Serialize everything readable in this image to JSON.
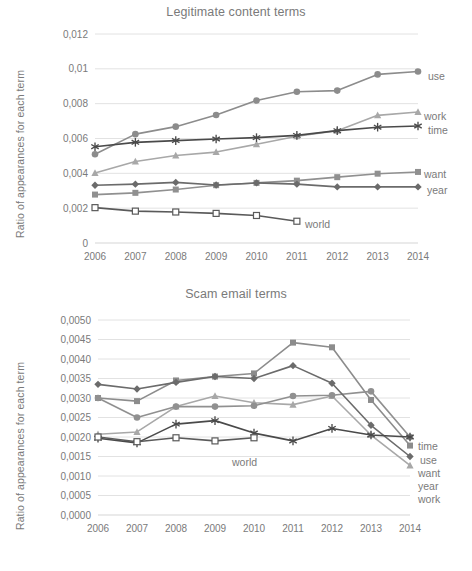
{
  "figure": {
    "panels": [
      "Legitimate content terms",
      "Scam email terms"
    ]
  },
  "top": {
    "title": "Legitimate content terms",
    "y_axis_title": "Ratio of appearances  for each term",
    "y_ticks": [
      "0",
      "0,002",
      "0,004",
      "0,006",
      "0,008",
      "0,01",
      "0,012"
    ],
    "x_ticks": [
      "2006",
      "2007",
      "2008",
      "2009",
      "2010",
      "2011",
      "2012",
      "2013",
      "2014"
    ],
    "labels": {
      "use": "use",
      "work": "work",
      "time": "time",
      "want": "want",
      "year": "year",
      "world": "world"
    }
  },
  "bottom": {
    "title": "Scam email terms",
    "y_axis_title": "Ratio of appearances  for each term",
    "y_ticks": [
      "0,0000",
      "0,0005",
      "0,0010",
      "0,0015",
      "0,0020",
      "0,0025",
      "0,0030",
      "0,0035",
      "0,0040",
      "0,0045",
      "0,0050"
    ],
    "x_ticks": [
      "2006",
      "2007",
      "2008",
      "2009",
      "2010",
      "2011",
      "2012",
      "2013",
      "2014"
    ],
    "labels": {
      "time": "time",
      "use": "use",
      "want": "want",
      "year": "year",
      "work": "work",
      "world": "world"
    }
  },
  "colors": {
    "use": "#8c8c8c",
    "work": "#a8a8a8",
    "time": "#4a4a4a",
    "want": "#909090",
    "year": "#6b6b6b",
    "world": "#5a5a5a",
    "gridline": "#e2e2e2",
    "text": "#7a7a7a"
  },
  "chart_data": [
    {
      "type": "line",
      "title": "Legitimate content terms",
      "xlabel": "",
      "ylabel": "Ratio of appearances  for each term",
      "x": [
        2006,
        2007,
        2008,
        2009,
        2010,
        2011,
        2012,
        2013,
        2014
      ],
      "ylim": [
        0,
        0.012
      ],
      "ytick_values": [
        0,
        0.002,
        0.004,
        0.006,
        0.008,
        0.01,
        0.012
      ],
      "grid": true,
      "legend_position": "right-inline-labels",
      "series": [
        {
          "name": "use",
          "marker": "circle",
          "color": "#8c8c8c",
          "values": [
            0.0051,
            0.00625,
            0.00668,
            0.00735,
            0.00818,
            0.00868,
            0.00875,
            0.00968,
            0.00985
          ]
        },
        {
          "name": "work",
          "marker": "triangle",
          "color": "#a8a8a8",
          "values": [
            0.00402,
            0.00468,
            0.00502,
            0.00522,
            0.00567,
            0.00613,
            0.00645,
            0.00733,
            0.00752
          ]
        },
        {
          "name": "time",
          "marker": "asterisk",
          "color": "#4a4a4a",
          "values": [
            0.00553,
            0.00578,
            0.00588,
            0.00597,
            0.00605,
            0.00618,
            0.00645,
            0.00665,
            0.00672
          ]
        },
        {
          "name": "want",
          "marker": "square",
          "color": "#909090",
          "values": [
            0.00278,
            0.00288,
            0.00307,
            0.00332,
            0.00345,
            0.00358,
            0.00378,
            0.00398,
            0.00408
          ]
        },
        {
          "name": "year",
          "marker": "diamond",
          "color": "#6b6b6b",
          "values": [
            0.00332,
            0.00338,
            0.00348,
            0.00333,
            0.00345,
            0.00338,
            0.00322,
            0.00322,
            0.00322
          ]
        },
        {
          "name": "world",
          "marker": "open-square",
          "color": "#5a5a5a",
          "values": [
            0.00203,
            0.00183,
            0.00178,
            0.0017,
            0.00158,
            0.00125,
            null,
            null,
            null
          ]
        }
      ]
    },
    {
      "type": "line",
      "title": "Scam email terms",
      "xlabel": "",
      "ylabel": "Ratio of appearances  for each term",
      "x": [
        2006,
        2007,
        2008,
        2009,
        2010,
        2011,
        2012,
        2013,
        2014
      ],
      "ylim": [
        0,
        0.005
      ],
      "ytick_values": [
        0,
        0.0005,
        0.001,
        0.0015,
        0.002,
        0.0025,
        0.003,
        0.0035,
        0.004,
        0.0045,
        0.005
      ],
      "grid": true,
      "legend_position": "right-inline-labels",
      "series": [
        {
          "name": "use",
          "marker": "square",
          "color": "#8c8c8c",
          "values": [
            0.003,
            0.00292,
            0.00345,
            0.00355,
            0.00363,
            0.00442,
            0.0043,
            0.00295,
            0.00178
          ]
        },
        {
          "name": "work",
          "marker": "triangle",
          "color": "#a8a8a8",
          "values": [
            0.00207,
            0.00213,
            0.00278,
            0.00305,
            0.00288,
            0.00283,
            0.00305,
            0.00205,
            0.00127
          ]
        },
        {
          "name": "want",
          "marker": "circle",
          "color": "#909090",
          "values": [
            0.003,
            0.0025,
            0.00278,
            0.00278,
            0.0028,
            0.00305,
            0.00307,
            0.00317,
            0.002
          ]
        },
        {
          "name": "year",
          "marker": "diamond",
          "color": "#6b6b6b",
          "values": [
            0.00335,
            0.00323,
            0.0034,
            0.00355,
            0.0035,
            0.00383,
            0.00338,
            0.0023,
            0.0015
          ]
        },
        {
          "name": "time",
          "marker": "asterisk",
          "color": "#4a4a4a",
          "values": [
            0.00197,
            0.00185,
            0.00233,
            0.00242,
            0.0021,
            0.0019,
            0.00222,
            0.00205,
            0.002
          ]
        },
        {
          "name": "world",
          "marker": "open-square",
          "color": "#5a5a5a",
          "values": [
            0.002,
            0.00188,
            0.00198,
            0.0019,
            0.00198,
            null,
            null,
            null,
            null
          ]
        }
      ]
    }
  ]
}
